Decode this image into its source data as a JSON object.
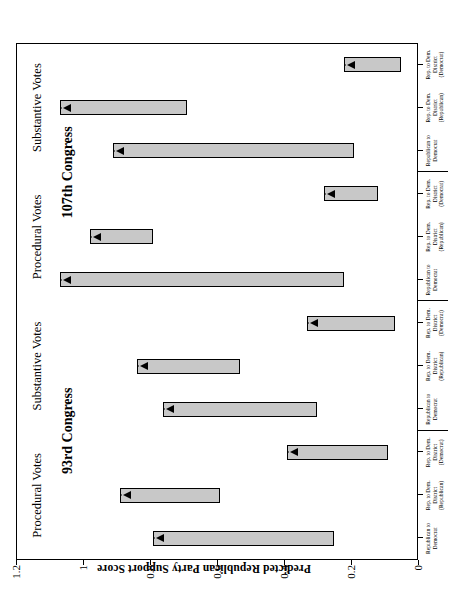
{
  "axis": {
    "y_title": "Predicted Republican Party Support Score",
    "y_ticks": [
      "0",
      "0.2",
      "0.4",
      "0.6",
      "0.8",
      "1",
      "1.2"
    ],
    "y_min": 0,
    "y_max": 1.2
  },
  "panels": [
    {
      "congress": "93rd Congress",
      "groups": [
        {
          "vote_type": "Procedural Votes"
        },
        {
          "vote_type": "Substantive Votes"
        }
      ]
    },
    {
      "congress": "107th Congress",
      "groups": [
        {
          "vote_type": "Procedural Votes"
        },
        {
          "vote_type": "Substantive Votes"
        }
      ]
    }
  ],
  "category_labels": [
    "Republican to\nDemocrat",
    "Rep. to Dem.\nDistrict\n(Republican)",
    "Rep. to Dem.\nDistrict\n(Democrat)"
  ],
  "chart_data": {
    "type": "bar",
    "title": "",
    "subtitle": "",
    "xlabel": "",
    "ylabel": "Predicted Republican Party Support Score",
    "ylim": [
      0,
      1.2
    ],
    "ytick_labels": [
      "0",
      "0.2",
      "0.4",
      "0.6",
      "0.8",
      "1",
      "1.2"
    ],
    "grid": false,
    "legend": "none",
    "orientation": "floating-range-bars-with-arrow-markers",
    "note": "Each bar is a floating range (confidence interval) with an arrowhead marker at its upper end.",
    "panels": [
      {
        "congress": "93rd Congress",
        "groups": [
          {
            "vote_type": "Procedural Votes",
            "categories": [
              "Republican to Democrat",
              "Rep. to Dem. District (Republican)",
              "Rep. to Dem. District (Democrat)"
            ],
            "ranges": [
              [
                0.25,
                0.79
              ],
              [
                0.59,
                0.89
              ],
              [
                0.09,
                0.39
              ]
            ],
            "marker_values": [
              0.79,
              0.89,
              0.39
            ]
          },
          {
            "vote_type": "Substantive Votes",
            "categories": [
              "Republican to Democrat",
              "Rep. to Dem. District (Republican)",
              "Rep. to Dem. District (Democrat)"
            ],
            "ranges": [
              [
                0.3,
                0.76
              ],
              [
                0.53,
                0.84
              ],
              [
                0.07,
                0.33
              ]
            ],
            "marker_values": [
              0.76,
              0.84,
              0.33
            ]
          }
        ]
      },
      {
        "congress": "107th Congress",
        "groups": [
          {
            "vote_type": "Procedural Votes",
            "categories": [
              "Republican to Democrat",
              "Rep. to Dem. District (Republican)",
              "Rep. to Dem. District (Democrat)"
            ],
            "ranges": [
              [
                0.22,
                1.07
              ],
              [
                0.79,
                0.98
              ],
              [
                0.12,
                0.28
              ]
            ],
            "marker_values": [
              1.07,
              0.98,
              0.28
            ]
          },
          {
            "vote_type": "Substantive Votes",
            "categories": [
              "Republican to Democrat",
              "Rep. to Dem. District (Republican)",
              "Rep. to Dem. District (Democrat)"
            ],
            "ranges": [
              [
                0.19,
                0.91
              ],
              [
                0.69,
                1.07
              ],
              [
                0.05,
                0.22
              ]
            ],
            "marker_values": [
              0.91,
              1.07,
              0.22
            ]
          }
        ]
      }
    ],
    "colors": {
      "bar_fill": "#c8c8c8",
      "bar_stroke": "#000000",
      "background": "#ffffff",
      "text": "#000000"
    }
  }
}
